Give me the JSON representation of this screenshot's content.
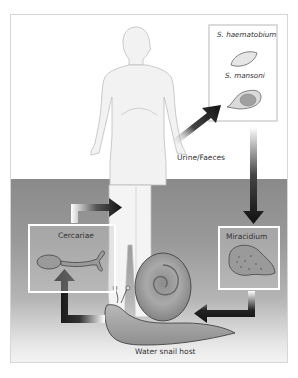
{
  "diagram": {
    "labels": {
      "egg_species_1": "S. haematobium",
      "egg_species_2": "S. mansoni",
      "excretion": "Urine/Faeces",
      "larva_free_swimming_host_seeking": "Cercariae",
      "larva_hatched": "Miracidium",
      "intermediate_host": "Water snail host"
    },
    "nodes": [
      {
        "id": "human",
        "name": "Human host",
        "icon": "human-figure"
      },
      {
        "id": "eggs",
        "name": "Eggs box",
        "icon": "egg-icons"
      },
      {
        "id": "miracidium",
        "name": "Miracidium",
        "icon": "miracidium-larva"
      },
      {
        "id": "snail",
        "name": "Water snail host",
        "icon": "snail"
      },
      {
        "id": "cercariae",
        "name": "Cercariae",
        "icon": "cercaria-larva"
      }
    ],
    "edges": [
      {
        "from": "human",
        "to": "eggs",
        "label": "Urine/Faeces"
      },
      {
        "from": "eggs",
        "to": "miracidium"
      },
      {
        "from": "miracidium",
        "to": "snail"
      },
      {
        "from": "snail",
        "to": "cercariae"
      },
      {
        "from": "cercariae",
        "to": "human"
      }
    ],
    "colors": {
      "water_top": "#8a8a8a",
      "water_bottom": "#f4f4f4",
      "arrow": "#1a1a1a",
      "box_border": "#ffffff",
      "frame_border": "#d6d6d6"
    }
  }
}
